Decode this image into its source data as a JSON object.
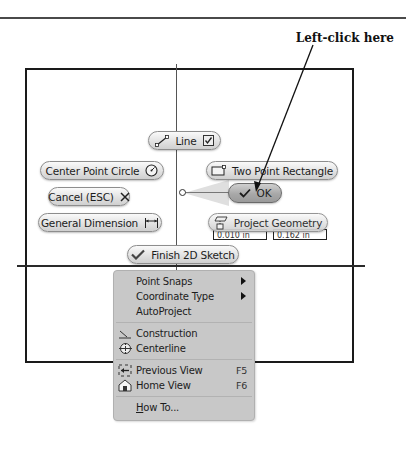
{
  "annotation": {
    "callout_text": "Left-click here"
  },
  "canvas": {
    "rect_color": "#1a1a1a",
    "axis_color": "#555555"
  },
  "marking_menu": {
    "line": {
      "label": "Line",
      "icon": "line-icon",
      "check_icon": "checkbox-icon"
    },
    "center_point_circle": {
      "label": "Center Point Circle",
      "icon": "circle-icon"
    },
    "two_point_rectangle": {
      "label": "Two Point Rectangle",
      "icon": "rectangle-icon"
    },
    "cancel": {
      "label": "Cancel (ESC)",
      "icon": "close-icon"
    },
    "ok": {
      "label": "OK",
      "icon": "checkmark-icon"
    },
    "general_dimension": {
      "label": "General Dimension",
      "icon": "dimension-icon"
    },
    "project_geometry": {
      "label": "Project Geometry",
      "icon": "project-geometry-icon"
    },
    "finish_sketch": {
      "label": "Finish 2D Sketch",
      "icon": "checkmark-icon"
    }
  },
  "dimension_inputs": [
    {
      "value": "0.010 in"
    },
    {
      "value": "0.162 in"
    }
  ],
  "context_menu": {
    "items": [
      {
        "label": "Point Snaps",
        "submenu": true
      },
      {
        "label": "Coordinate Type",
        "submenu": true
      },
      {
        "label": "AutoProject"
      },
      {
        "label": "Construction",
        "icon": "construction-icon"
      },
      {
        "label": "Centerline",
        "icon": "centerline-icon"
      },
      {
        "label": "Previous View",
        "shortcut": "F5",
        "icon": "previous-view-icon"
      },
      {
        "label": "Home View",
        "shortcut": "F6",
        "icon": "home-view-icon"
      },
      {
        "label": "How To...",
        "mnemonic": "H"
      }
    ]
  }
}
